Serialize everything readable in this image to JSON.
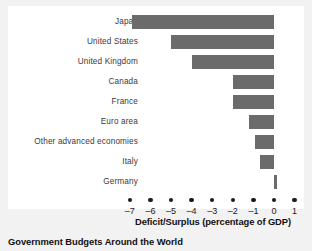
{
  "figure": {
    "caption": "Government Budgets Around the World",
    "axis_title": "Deficit/Surplus (percentage of GDP)",
    "bar_color": "#6b6b6b",
    "text_color": "#3a3a3a",
    "background": "#ffffff"
  },
  "chart_data": {
    "type": "bar",
    "orientation": "horizontal",
    "title": "Government Budgets Around the World",
    "xlabel": "Deficit/Surplus (percentage of GDP)",
    "ylabel": "",
    "xlim": [
      -7.6,
      1.4
    ],
    "xticks": [
      -7,
      -6,
      -5,
      -4,
      -3,
      -2,
      -1,
      0,
      1
    ],
    "xtick_labels": [
      "–7",
      "–6",
      "–5",
      "–4",
      "–3",
      "–2",
      "–1",
      "0",
      "1"
    ],
    "grid": false,
    "legend": null,
    "categories": [
      "Japan",
      "United States",
      "United Kingdom",
      "Canada",
      "France",
      "Euro area",
      "Other advanced economies",
      "Italy",
      "Germany"
    ],
    "values": [
      -6.9,
      -5.0,
      -4.0,
      -2.0,
      -2.0,
      -1.2,
      -0.9,
      -0.7,
      0.15
    ]
  }
}
